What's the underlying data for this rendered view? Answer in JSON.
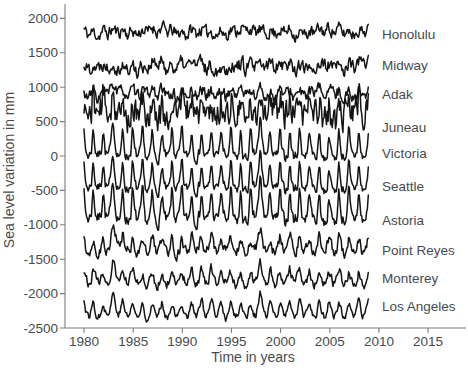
{
  "figure": {
    "background": "#ffffff",
    "trace_color": "#141414",
    "axis_color": "#7d7d7d",
    "text_color": "#474b4e"
  },
  "chart_data": {
    "type": "line",
    "title": "",
    "xlabel": "Time in years",
    "ylabel": "Sea level variation in mm",
    "xlim": [
      1978,
      2019
    ],
    "ylim": [
      -2500,
      2200
    ],
    "xticks": [
      1980,
      1985,
      1990,
      1995,
      2000,
      2005,
      2010,
      2015
    ],
    "yticks": [
      2000,
      1500,
      1000,
      500,
      0,
      -500,
      -1000,
      -1500,
      -2000,
      -2500
    ],
    "grid": false,
    "legend_position": "right-of-traces",
    "x_data_range": [
      1980,
      2008.92
    ],
    "points_per_year": 12,
    "event_years": [
      1983.0,
      1997.9
    ],
    "stations": [
      "Honolulu",
      "Midway",
      "Adak",
      "Juneau",
      "Victoria",
      "Seattle",
      "Astoria",
      "Point Reyes",
      "Monterey",
      "Los Angeles"
    ],
    "series": [
      {
        "name": "Honolulu",
        "offset_mm": 1810,
        "seasonal_amp_mm": 30,
        "spike_amp_mm": 0,
        "noise_amp_mm": 75,
        "event_amp_mm": 0,
        "smoothness": 0.5,
        "seed": 11,
        "label_mm": 1760
      },
      {
        "name": "Midway",
        "offset_mm": 1310,
        "seasonal_amp_mm": 35,
        "spike_amp_mm": 0,
        "noise_amp_mm": 85,
        "event_amp_mm": 0,
        "smoothness": 0.45,
        "seed": 22,
        "label_mm": 1320
      },
      {
        "name": "Adak",
        "offset_mm": 910,
        "seasonal_amp_mm": 40,
        "spike_amp_mm": 0,
        "noise_amp_mm": 70,
        "event_amp_mm": 60,
        "smoothness": 0.45,
        "seed": 33,
        "label_mm": 890
      },
      {
        "name": "Juneau",
        "offset_mm": 620,
        "seasonal_amp_mm": 50,
        "spike_amp_mm": 150,
        "noise_amp_mm": 160,
        "event_amp_mm": 120,
        "smoothness": 0.35,
        "seed": 44,
        "label_mm": 420
      },
      {
        "name": "Victoria",
        "offset_mm": 40,
        "seasonal_amp_mm": 55,
        "spike_amp_mm": 270,
        "noise_amp_mm": 60,
        "event_amp_mm": 170,
        "smoothness": 0.45,
        "seed": 7,
        "label_mm": 30
      },
      {
        "name": "Seattle",
        "offset_mm": -430,
        "seasonal_amp_mm": 60,
        "spike_amp_mm": 250,
        "noise_amp_mm": 60,
        "event_amp_mm": 170,
        "smoothness": 0.45,
        "seed": 7,
        "label_mm": -440
      },
      {
        "name": "Astoria",
        "offset_mm": -870,
        "seasonal_amp_mm": 70,
        "spike_amp_mm": 280,
        "noise_amp_mm": 75,
        "event_amp_mm": 190,
        "smoothness": 0.45,
        "seed": 7,
        "label_mm": -930
      },
      {
        "name": "Point Reyes",
        "offset_mm": -1330,
        "seasonal_amp_mm": 55,
        "spike_amp_mm": 90,
        "noise_amp_mm": 65,
        "event_amp_mm": 150,
        "smoothness": 0.5,
        "seed": 55,
        "label_mm": -1370
      },
      {
        "name": "Monterey",
        "offset_mm": -1790,
        "seasonal_amp_mm": 60,
        "spike_amp_mm": 60,
        "noise_amp_mm": 55,
        "event_amp_mm": 120,
        "smoothness": 0.5,
        "seed": 66,
        "label_mm": -1780
      },
      {
        "name": "Los Angeles",
        "offset_mm": -2260,
        "seasonal_amp_mm": 80,
        "spike_amp_mm": 60,
        "noise_amp_mm": 45,
        "event_amp_mm": 120,
        "smoothness": 0.5,
        "seed": 77,
        "label_mm": -2180
      }
    ]
  }
}
